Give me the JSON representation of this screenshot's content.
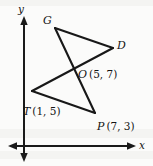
{
  "figure": {
    "background_color": "#fbfbfa",
    "ink_color": "#1a1a1a",
    "axes": {
      "x_label": "x",
      "y_label": "y",
      "origin_px": [
        24,
        146
      ],
      "x_axis_from_px": [
        10,
        146
      ],
      "x_axis_to_px": [
        135,
        146
      ],
      "y_axis_from_px": [
        24,
        18
      ],
      "y_axis_to_px": [
        24,
        160
      ]
    },
    "points": [
      {
        "name": "G",
        "label": "G",
        "coord_text": "",
        "px": [
          55,
          28
        ],
        "label_px": [
          43,
          16
        ]
      },
      {
        "name": "D",
        "label": "D",
        "coord_text": "",
        "px": [
          113,
          48
        ],
        "label_px": [
          117,
          40
        ]
      },
      {
        "name": "O",
        "label": "O",
        "coord_text": "(5, 7)",
        "px": [
          75,
          71
        ],
        "label_px": [
          78,
          65
        ]
      },
      {
        "name": "T",
        "label": "T",
        "coord_text": "(1, 5)",
        "px": [
          32,
          91
        ],
        "label_px": [
          24,
          102
        ]
      },
      {
        "name": "P",
        "label": "P",
        "coord_text": "(7, 3)",
        "px": [
          95,
          113
        ],
        "label_px": [
          98,
          117
        ]
      }
    ],
    "segments": [
      {
        "from": "G",
        "to": "D"
      },
      {
        "from": "G",
        "to": "P"
      },
      {
        "from": "T",
        "to": "D"
      },
      {
        "from": "T",
        "to": "P"
      }
    ],
    "labels": {
      "G": "G",
      "D": "D",
      "O": "O",
      "O_coord": "(5, 7)",
      "T": "T",
      "T_coord": "(1, 5)",
      "P": "P",
      "P_coord": "(7, 3)",
      "x_axis": "x",
      "y_axis": "y"
    }
  }
}
